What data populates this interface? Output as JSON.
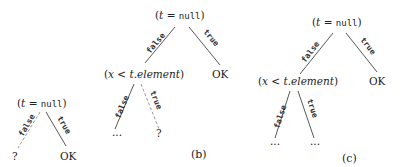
{
  "trees": [
    {
      "caption": "(a)",
      "root": {
        "pre": "(",
        "var": "t",
        "op": " = ",
        "kw": "null",
        "post": ")"
      },
      "edges": {
        "false": "false",
        "true": "true"
      },
      "leaves": {
        "left": "?",
        "right": "OK"
      }
    },
    {
      "caption": "(b)",
      "root": {
        "pre": "(",
        "var": "t",
        "op": " = ",
        "kw": "null",
        "post": ")"
      },
      "edges": {
        "false": "false",
        "true": "true",
        "inner_false": "false",
        "inner_true": "true"
      },
      "inner": {
        "pre": "(",
        "var": "x",
        "op": " < ",
        "expr": "t.element",
        "post": ")"
      },
      "leaves": {
        "right": "OK",
        "inner_left": "...",
        "inner_right": "?"
      }
    },
    {
      "caption": "(c)",
      "root": {
        "pre": "(",
        "var": "t",
        "op": " = ",
        "kw": "null",
        "post": ")"
      },
      "edges": {
        "false": "false",
        "true": "true",
        "inner_false": "false",
        "inner_true": "true"
      },
      "inner": {
        "pre": "(",
        "var": "x",
        "op": " < ",
        "expr": "t.element",
        "post": ")"
      },
      "leaves": {
        "right": "OK",
        "inner_left": "...",
        "inner_right": "..."
      }
    }
  ]
}
